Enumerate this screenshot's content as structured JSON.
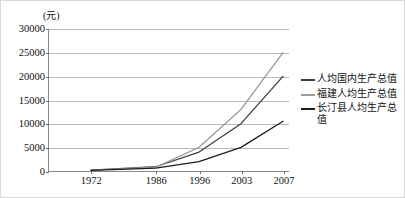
{
  "chart_data": {
    "type": "line",
    "title": "",
    "subtitle": "",
    "xlabel": "",
    "ylabel": "",
    "unit_label": "(元)",
    "categories": [
      "1972",
      "1986",
      "1996",
      "2003",
      "2007"
    ],
    "x": [
      1972,
      1986,
      1996,
      2003,
      2007
    ],
    "ylim": [
      0,
      30000
    ],
    "ytick_labels": [
      "30000",
      "25000",
      "20000",
      "15000",
      "10000",
      "5000",
      "0"
    ],
    "ytick_values": [
      30000,
      25000,
      20000,
      15000,
      10000,
      5000,
      0
    ],
    "grid": true,
    "legend_position": "right",
    "series": [
      {
        "name": "人均国内生产总值",
        "color": "#3f3f3f",
        "values": [
          200,
          900,
          4000,
          10000,
          20000
        ]
      },
      {
        "name": "福建人均生产总值",
        "color": "#9a9a9a",
        "values": [
          180,
          800,
          5000,
          13000,
          25000
        ]
      },
      {
        "name": "长汀县人均生产总值",
        "color": "#1c1c1c",
        "values": [
          150,
          600,
          2000,
          5000,
          10500
        ]
      }
    ]
  },
  "legend": {
    "items": [
      {
        "label": "人均国内生产总值",
        "color": "#3f3f3f"
      },
      {
        "label": "福建人均生产总值",
        "color": "#9a9a9a"
      },
      {
        "label": "长汀县人均生产总值",
        "color": "#1c1c1c"
      }
    ]
  }
}
